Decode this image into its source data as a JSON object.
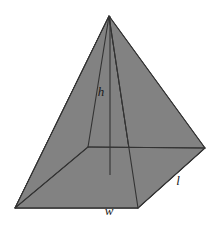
{
  "figure": {
    "name": "rectangular-pyramid",
    "background_color": "#ffffff",
    "face_fill_color": "#828282",
    "edge_color": "#333333",
    "label_color": "#1a1a1a",
    "canvas": {
      "width": 218,
      "height": 226
    }
  },
  "vertices": {
    "apex": {
      "name": "apex",
      "x": 109,
      "y": 16
    },
    "base_front_left": {
      "name": "base-front-left",
      "x": 15,
      "y": 208
    },
    "base_front_right": {
      "name": "base-front-right",
      "x": 138,
      "y": 208
    },
    "base_right": {
      "name": "base-right",
      "x": 205,
      "y": 148
    },
    "base_back_hidden": {
      "name": "base-back-hidden",
      "x": 88,
      "y": 147
    },
    "height_foot": {
      "name": "height-foot",
      "x": 110,
      "y": 175
    }
  },
  "faces": [
    {
      "name": "left-face",
      "points": "109,16 15,208 88,147"
    },
    {
      "name": "front-face",
      "points": "109,16 15,208 138,208"
    },
    {
      "name": "right-face",
      "points": "109,16 138,208 205,148"
    },
    {
      "name": "base-visible",
      "points": "15,208 138,208 205,148 88,147"
    }
  ],
  "edges": [
    {
      "name": "edge-apex-to-front-left",
      "x1": 109,
      "y1": 16,
      "x2": 15,
      "y2": 208
    },
    {
      "name": "edge-apex-to-front-right",
      "x1": 109,
      "y1": 16,
      "x2": 138,
      "y2": 208
    },
    {
      "name": "edge-apex-to-right",
      "x1": 109,
      "y1": 16,
      "x2": 205,
      "y2": 148
    },
    {
      "name": "edge-base-front",
      "x1": 15,
      "y1": 208,
      "x2": 138,
      "y2": 208
    },
    {
      "name": "edge-base-front-right-to-right",
      "x1": 138,
      "y1": 208,
      "x2": 205,
      "y2": 148
    },
    {
      "name": "edge-base-back-left",
      "x1": 15,
      "y1": 208,
      "x2": 88,
      "y2": 147
    },
    {
      "name": "edge-base-back-right",
      "x1": 88,
      "y1": 147,
      "x2": 205,
      "y2": 148
    },
    {
      "name": "edge-apex-to-back-hidden",
      "x1": 109,
      "y1": 16,
      "x2": 88,
      "y2": 147
    }
  ],
  "height_line": {
    "name": "height-line",
    "x1": 110,
    "y1": 16,
    "x2": 110,
    "y2": 175
  },
  "labels": {
    "height": {
      "text": "h",
      "x": 101,
      "y": 93
    },
    "width": {
      "text": "w",
      "x": 109,
      "y": 212
    },
    "length": {
      "text": "l",
      "x": 178,
      "y": 182
    }
  }
}
